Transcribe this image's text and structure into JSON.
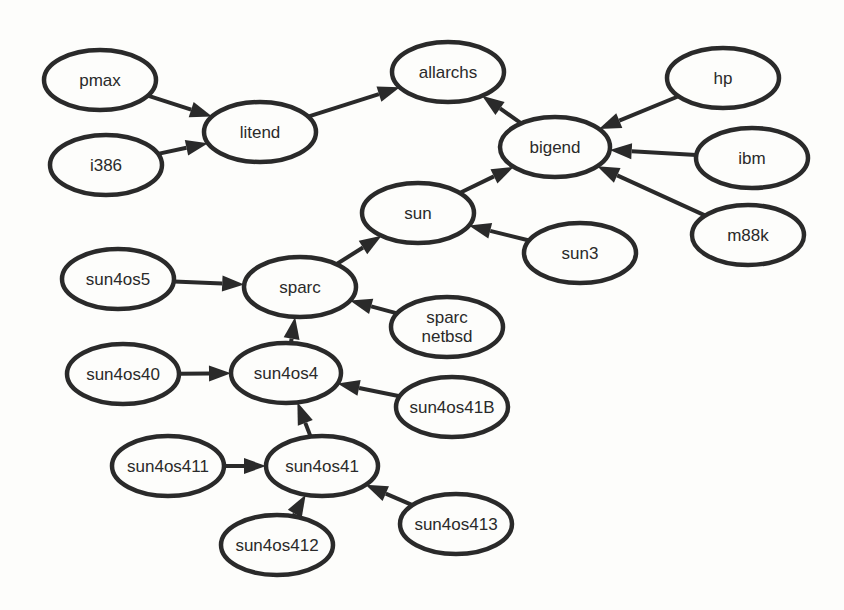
{
  "diagram": {
    "type": "directed-graph",
    "colors": {
      "stroke": "#2a2a2a",
      "background": "#fdfdfb"
    },
    "nodes": [
      {
        "id": "pmax",
        "label": [
          "pmax"
        ],
        "cx": 100,
        "cy": 80,
        "rx": 56,
        "ry": 30
      },
      {
        "id": "i386",
        "label": [
          "i386"
        ],
        "cx": 106,
        "cy": 165,
        "rx": 56,
        "ry": 30
      },
      {
        "id": "litend",
        "label": [
          "litend"
        ],
        "cx": 260,
        "cy": 132,
        "rx": 56,
        "ry": 30
      },
      {
        "id": "allarchs",
        "label": [
          "allarchs"
        ],
        "cx": 448,
        "cy": 72,
        "rx": 56,
        "ry": 30
      },
      {
        "id": "bigend",
        "label": [
          "bigend"
        ],
        "cx": 555,
        "cy": 147,
        "rx": 55,
        "ry": 30
      },
      {
        "id": "hp",
        "label": [
          "hp"
        ],
        "cx": 723,
        "cy": 78,
        "rx": 56,
        "ry": 30
      },
      {
        "id": "ibm",
        "label": [
          "ibm"
        ],
        "cx": 752,
        "cy": 158,
        "rx": 56,
        "ry": 30
      },
      {
        "id": "m88k",
        "label": [
          "m88k"
        ],
        "cx": 748,
        "cy": 235,
        "rx": 56,
        "ry": 30
      },
      {
        "id": "sun",
        "label": [
          "sun"
        ],
        "cx": 418,
        "cy": 213,
        "rx": 56,
        "ry": 30
      },
      {
        "id": "sun3",
        "label": [
          "sun3"
        ],
        "cx": 580,
        "cy": 253,
        "rx": 56,
        "ry": 30
      },
      {
        "id": "sun4os5",
        "label": [
          "sun4os5"
        ],
        "cx": 118,
        "cy": 279,
        "rx": 56,
        "ry": 30
      },
      {
        "id": "sparc",
        "label": [
          "sparc"
        ],
        "cx": 300,
        "cy": 287,
        "rx": 56,
        "ry": 30
      },
      {
        "id": "sparc_netbsd",
        "label": [
          "sparc",
          "netbsd"
        ],
        "cx": 447,
        "cy": 327,
        "rx": 56,
        "ry": 30
      },
      {
        "id": "sun4os40",
        "label": [
          "sun4os40"
        ],
        "cx": 123,
        "cy": 374,
        "rx": 56,
        "ry": 30
      },
      {
        "id": "sun4os4",
        "label": [
          "sun4os4"
        ],
        "cx": 286,
        "cy": 373,
        "rx": 55,
        "ry": 30
      },
      {
        "id": "sun4os41B",
        "label": [
          "sun4os41B"
        ],
        "cx": 452,
        "cy": 407,
        "rx": 56,
        "ry": 30
      },
      {
        "id": "sun4os411",
        "label": [
          "sun4os411"
        ],
        "cx": 168,
        "cy": 466,
        "rx": 56,
        "ry": 30
      },
      {
        "id": "sun4os41",
        "label": [
          "sun4os41"
        ],
        "cx": 322,
        "cy": 466,
        "rx": 56,
        "ry": 30
      },
      {
        "id": "sun4os412",
        "label": [
          "sun4os412"
        ],
        "cx": 277,
        "cy": 545,
        "rx": 56,
        "ry": 30
      },
      {
        "id": "sun4os413",
        "label": [
          "sun4os413"
        ],
        "cx": 456,
        "cy": 524,
        "rx": 56,
        "ry": 30
      }
    ],
    "edges": [
      {
        "from": "pmax",
        "to": "litend"
      },
      {
        "from": "i386",
        "to": "litend"
      },
      {
        "from": "litend",
        "to": "allarchs"
      },
      {
        "from": "bigend",
        "to": "allarchs"
      },
      {
        "from": "hp",
        "to": "bigend"
      },
      {
        "from": "ibm",
        "to": "bigend"
      },
      {
        "from": "m88k",
        "to": "bigend"
      },
      {
        "from": "sun",
        "to": "bigend"
      },
      {
        "from": "sun3",
        "to": "sun"
      },
      {
        "from": "sparc",
        "to": "sun"
      },
      {
        "from": "sun4os5",
        "to": "sparc"
      },
      {
        "from": "sparc_netbsd",
        "to": "sparc"
      },
      {
        "from": "sun4os4",
        "to": "sparc"
      },
      {
        "from": "sun4os40",
        "to": "sun4os4"
      },
      {
        "from": "sun4os41B",
        "to": "sun4os4"
      },
      {
        "from": "sun4os41",
        "to": "sun4os4"
      },
      {
        "from": "sun4os411",
        "to": "sun4os41"
      },
      {
        "from": "sun4os412",
        "to": "sun4os41"
      },
      {
        "from": "sun4os413",
        "to": "sun4os41"
      }
    ]
  }
}
